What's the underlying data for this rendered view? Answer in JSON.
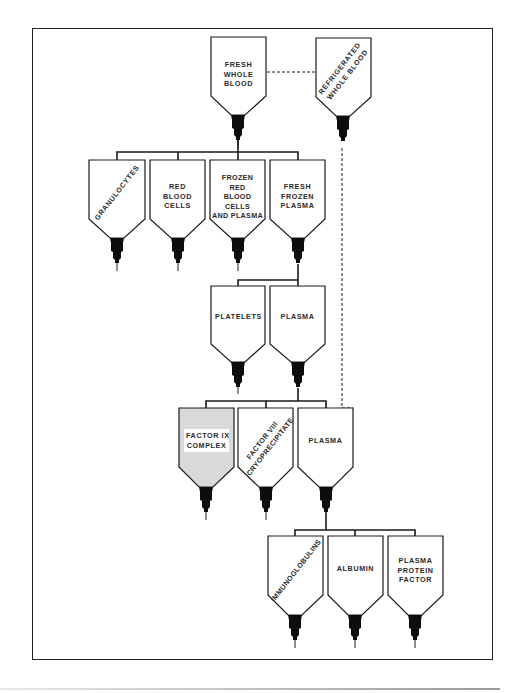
{
  "colors": {
    "outline": "#1a1a1a",
    "nozzle": "#0d0d0d",
    "highlight_fill": "#d9d9d9",
    "background": "#ffffff"
  },
  "nodes": {
    "fresh_whole_blood": {
      "label": "FRESH\nWHOLE\nBLOOD",
      "lines": [
        "FRESH",
        "WHOLE",
        "BLOOD"
      ]
    },
    "refrigerated_whole_blood": {
      "lines": [
        "REFRIGERATED",
        "WHOLE BLOOD"
      ]
    },
    "granulocytes": {
      "lines": [
        "GRANULOCYTES"
      ]
    },
    "red_blood_cells": {
      "lines": [
        "RED",
        "BLOOD",
        "CELLS"
      ]
    },
    "frozen_rbc_plasma": {
      "lines": [
        "FROZEN",
        "RED",
        "BLOOD",
        "CELLS",
        "AND PLASMA"
      ]
    },
    "fresh_frozen_plasma": {
      "lines": [
        "FRESH",
        "FROZEN",
        "PLASMA"
      ]
    },
    "platelets": {
      "lines": [
        "PLATELETS"
      ]
    },
    "plasma_1": {
      "lines": [
        "PLASMA"
      ]
    },
    "factor_ix_complex": {
      "lines": [
        "FACTOR IX",
        "COMPLEX"
      ],
      "highlighted": true
    },
    "factor_viii_cryo": {
      "lines": [
        "FACTOR VIII",
        "CRYOPRECIPITATE"
      ]
    },
    "plasma_2": {
      "lines": [
        "PLASMA"
      ]
    },
    "immunoglobulins": {
      "lines": [
        "IMMUNOGLOBULINS"
      ]
    },
    "albumin": {
      "lines": [
        "ALBUMIN"
      ]
    },
    "plasma_protein_factor": {
      "lines": [
        "PLASMA",
        "PROTEIN",
        "FACTOR"
      ]
    }
  },
  "edges": [
    {
      "from": "fresh_whole_blood",
      "to": "refrigerated_whole_blood",
      "style": "dashed"
    },
    {
      "from": "fresh_whole_blood",
      "to": [
        "granulocytes",
        "red_blood_cells",
        "frozen_rbc_plasma",
        "fresh_frozen_plasma"
      ],
      "style": "solid"
    },
    {
      "from": "fresh_frozen_plasma",
      "to": [
        "platelets",
        "plasma_1"
      ],
      "style": "solid"
    },
    {
      "from": "plasma_1",
      "to": [
        "factor_ix_complex",
        "factor_viii_cryo",
        "plasma_2"
      ],
      "style": "solid"
    },
    {
      "from": "refrigerated_whole_blood",
      "to": "plasma_2",
      "style": "dashed"
    },
    {
      "from": "plasma_2",
      "to": [
        "immunoglobulins",
        "albumin",
        "plasma_protein_factor"
      ],
      "style": "solid"
    }
  ]
}
